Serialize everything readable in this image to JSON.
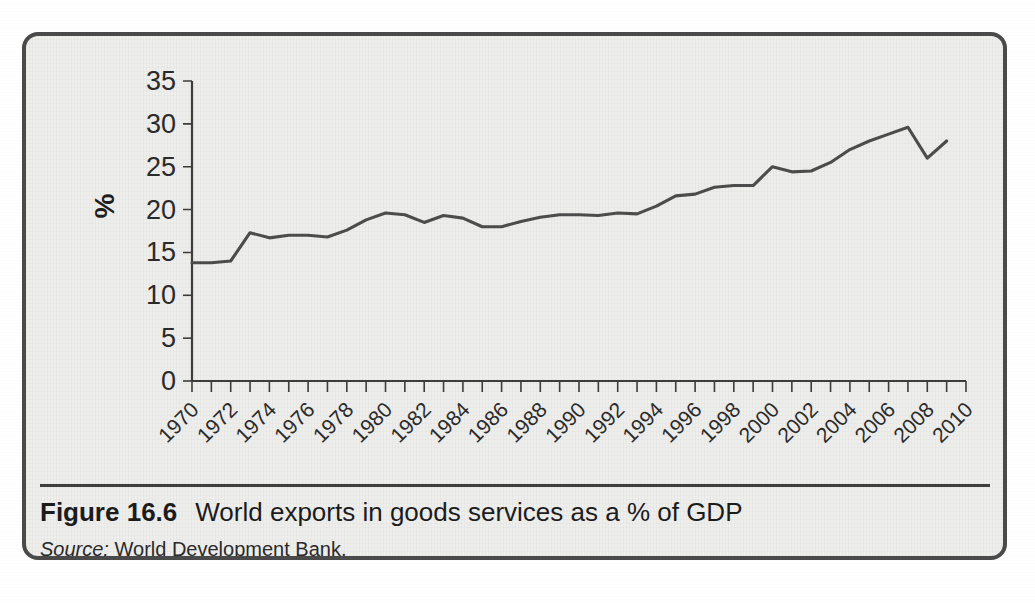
{
  "figure": {
    "label": "Figure 16.6",
    "title": "World exports in goods services as a % of GDP",
    "source_label": "Source:",
    "source_text": "World Development Bank.",
    "border_color": "#4a4a4a",
    "panel_color": "#eeeeec"
  },
  "chart_data": {
    "type": "line",
    "title": "World exports in goods services as a % of GDP",
    "xlabel": "",
    "ylabel": "%",
    "ylim": [
      0,
      35
    ],
    "xlim": [
      1970,
      2010
    ],
    "yticks": [
      0,
      5,
      10,
      15,
      20,
      25,
      30,
      35
    ],
    "ytick_labels": [
      "0",
      "5",
      "10",
      "15",
      "20",
      "25",
      "30",
      "35"
    ],
    "xticks": [
      1970,
      1972,
      1974,
      1976,
      1978,
      1980,
      1982,
      1984,
      1986,
      1988,
      1990,
      1992,
      1994,
      1996,
      1998,
      2000,
      2002,
      2004,
      2006,
      2008,
      2010
    ],
    "xtick_labels": [
      "1970",
      "1972",
      "1974",
      "1976",
      "1978",
      "1980",
      "1982",
      "1984",
      "1986",
      "1988",
      "1990",
      "1992",
      "1994",
      "1996",
      "1998",
      "2000",
      "2002",
      "2004",
      "2006",
      "2008",
      "2010"
    ],
    "xtick_rotation": 45,
    "grid": false,
    "legend": false,
    "line_color": "#4d4d4d",
    "x": [
      1970,
      1971,
      1972,
      1973,
      1974,
      1975,
      1976,
      1977,
      1978,
      1979,
      1980,
      1981,
      1982,
      1983,
      1984,
      1985,
      1986,
      1987,
      1988,
      1989,
      1990,
      1991,
      1992,
      1993,
      1994,
      1995,
      1996,
      1997,
      1998,
      1999,
      2000,
      2001,
      2002,
      2003,
      2004,
      2005,
      2006,
      2007,
      2008,
      2009
    ],
    "series": [
      {
        "name": "World exports in goods services as a % of GDP",
        "values": [
          13.8,
          13.8,
          14.0,
          17.3,
          16.7,
          17.0,
          17.0,
          16.8,
          17.6,
          18.8,
          19.6,
          19.4,
          18.5,
          19.3,
          19.0,
          18.0,
          18.0,
          18.6,
          19.1,
          19.4,
          19.4,
          19.3,
          19.6,
          19.5,
          20.4,
          21.6,
          21.8,
          22.6,
          22.8,
          22.8,
          25.0,
          24.4,
          24.5,
          25.5,
          27.0,
          28.0,
          28.8,
          29.6,
          26.0,
          28.0
        ]
      }
    ]
  }
}
